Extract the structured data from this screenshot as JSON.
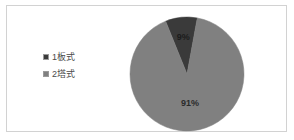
{
  "figure": {
    "background_color": "#ffffff",
    "frame_color": "#d2d2d2"
  },
  "legend": {
    "position": "left",
    "items": [
      {
        "label": "1板式",
        "marker": "square-marker",
        "color": "#3a3a3a"
      },
      {
        "label": "2塔式",
        "marker": "square-marker",
        "color": "#808080"
      }
    ]
  },
  "chart_data": {
    "type": "pie",
    "title": "",
    "subtitle": "",
    "xlabel": "",
    "ylabel": "",
    "categories": [
      "1板式",
      "2塔式"
    ],
    "values": [
      9,
      91
    ],
    "value_unit": "%",
    "data_labels": [
      "9%",
      "91%"
    ],
    "colors": [
      "#3a3a3a",
      "#808080"
    ],
    "start_angle_deg": -22,
    "direction": "clockwise",
    "legend_position": "left",
    "grid": false,
    "annotations": []
  }
}
